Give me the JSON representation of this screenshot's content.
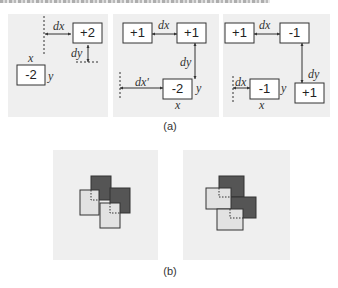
{
  "figure": {
    "top_strip": "",
    "caption_a": "(a)",
    "caption_b": "(b)",
    "panel_a": [
      {
        "boxes": [
          {
            "label": "+2",
            "x": 65,
            "y": 9
          },
          {
            "label": "-2",
            "x": 9,
            "y": 51
          }
        ],
        "annotations": {
          "dx": "dx",
          "dy": "dy",
          "x": "x",
          "y": "y"
        }
      },
      {
        "boxes": [
          {
            "label": "+1",
            "x": 10,
            "y": 9
          },
          {
            "label": "+1",
            "x": 64,
            "y": 9
          },
          {
            "label": "-2",
            "x": 50,
            "y": 65
          }
        ],
        "annotations": {
          "dx": "dx",
          "dy": "dy",
          "dx2": "dx'",
          "x": "x",
          "y": "y"
        }
      },
      {
        "boxes": [
          {
            "label": "+1",
            "x": 2,
            "y": 9
          },
          {
            "label": "-1",
            "x": 57,
            "y": 9
          },
          {
            "label": "-1",
            "x": 27,
            "y": 65
          },
          {
            "label": "+1",
            "x": 72,
            "y": 69
          }
        ],
        "annotations": {
          "dx": "dx",
          "dy": "dy",
          "dx2": "dx",
          "x": "x",
          "y": "y"
        }
      }
    ],
    "panel_b": [
      {
        "squares": [
          {
            "shade": "dark",
            "x": 38,
            "y": 26,
            "w": 20,
            "h": 24
          },
          {
            "shade": "light",
            "x": 27,
            "y": 40,
            "w": 19,
            "h": 25
          },
          {
            "shade": "dark",
            "x": 57,
            "y": 38,
            "w": 20,
            "h": 25
          },
          {
            "shade": "light",
            "x": 47,
            "y": 53,
            "w": 20,
            "h": 25
          }
        ]
      },
      {
        "squares": [
          {
            "shade": "dark",
            "x": 36,
            "y": 26,
            "w": 25,
            "h": 21
          },
          {
            "shade": "light",
            "x": 23,
            "y": 38,
            "w": 25,
            "h": 21
          },
          {
            "shade": "dark",
            "x": 47,
            "y": 47,
            "w": 26,
            "h": 21
          },
          {
            "shade": "light",
            "x": 34,
            "y": 59,
            "w": 26,
            "h": 21
          }
        ]
      }
    ],
    "colors": {
      "panel_bg": "#efefef",
      "box_fill": "#ffffff",
      "stroke": "#333333",
      "dark_square": "#555555",
      "light_square": "#e2e2e2"
    }
  }
}
